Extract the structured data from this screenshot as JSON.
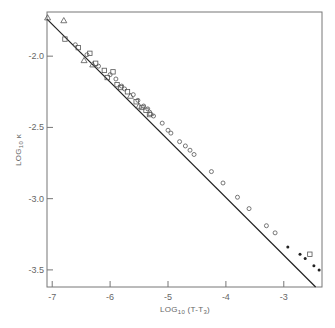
{
  "chart_data": {
    "type": "scatter",
    "title": "",
    "xlabel": "LOG10 (T-T3)",
    "xlabel_parts": {
      "main": "LOG",
      "sub": "10",
      "rest": " (T-T",
      "sub2": "3",
      "end": ")"
    },
    "ylabel": "LOG10 κ",
    "ylabel_parts": {
      "main": "LOG",
      "sub": "10",
      "rest": " κ"
    },
    "xlim": [
      -7.09,
      -2.34
    ],
    "ylim": [
      -3.62,
      -1.69
    ],
    "xticks": [
      -7,
      -6,
      -5,
      -4,
      -3
    ],
    "xtick_labels": [
      "-7",
      "-6",
      "-5",
      "-4",
      "-3"
    ],
    "yticks": [
      -2.0,
      -2.5,
      -3.0,
      -3.5
    ],
    "ytick_labels": [
      "-2.0",
      "-2.5",
      "-3.0",
      "-3.5"
    ],
    "grid": false,
    "legend": null,
    "fit_line": {
      "x": [
        -7.09,
        -2.45
      ],
      "y": [
        -1.74,
        -3.62
      ]
    },
    "series": [
      {
        "name": "triangles",
        "marker": "triangle-open",
        "points": [
          [
            -7.08,
            -1.73
          ],
          [
            -6.8,
            -1.75
          ],
          [
            -6.45,
            -2.03
          ],
          [
            -6.3,
            -2.06
          ],
          [
            -5.65,
            -2.28
          ],
          [
            -5.5,
            -2.35
          ],
          [
            -5.3,
            -2.4
          ]
        ]
      },
      {
        "name": "squares",
        "marker": "square-open",
        "points": [
          [
            -6.78,
            -1.88
          ],
          [
            -6.55,
            -1.94
          ],
          [
            -6.35,
            -1.98
          ],
          [
            -6.25,
            -2.05
          ],
          [
            -6.1,
            -2.1
          ],
          [
            -6.05,
            -2.15
          ],
          [
            -5.95,
            -2.11
          ],
          [
            -5.88,
            -2.2
          ],
          [
            -5.82,
            -2.22
          ],
          [
            -5.7,
            -2.25
          ],
          [
            -5.55,
            -2.32
          ],
          [
            -5.45,
            -2.36
          ],
          [
            -5.38,
            -2.38
          ],
          [
            -5.32,
            -2.41
          ],
          [
            -2.55,
            -3.39
          ]
        ]
      },
      {
        "name": "circles",
        "marker": "circle-open",
        "points": [
          [
            -6.6,
            -1.92
          ],
          [
            -6.4,
            -1.99
          ],
          [
            -6.2,
            -2.07
          ],
          [
            -6.0,
            -2.13
          ],
          [
            -5.9,
            -2.16
          ],
          [
            -5.8,
            -2.21
          ],
          [
            -5.75,
            -2.23
          ],
          [
            -5.6,
            -2.27
          ],
          [
            -5.52,
            -2.31
          ],
          [
            -5.42,
            -2.35
          ],
          [
            -5.35,
            -2.37
          ],
          [
            -5.25,
            -2.42
          ],
          [
            -5.1,
            -2.47
          ],
          [
            -5.0,
            -2.52
          ],
          [
            -4.95,
            -2.54
          ],
          [
            -4.8,
            -2.6
          ],
          [
            -4.7,
            -2.63
          ],
          [
            -4.62,
            -2.66
          ],
          [
            -4.55,
            -2.69
          ],
          [
            -4.25,
            -2.81
          ],
          [
            -4.05,
            -2.89
          ],
          [
            -3.8,
            -2.99
          ],
          [
            -3.6,
            -3.07
          ],
          [
            -3.3,
            -3.19
          ],
          [
            -3.15,
            -3.24
          ]
        ]
      },
      {
        "name": "filled-dots",
        "marker": "circle-filled",
        "points": [
          [
            -2.93,
            -3.34
          ],
          [
            -2.72,
            -3.39
          ],
          [
            -2.63,
            -3.42
          ],
          [
            -2.48,
            -3.47
          ],
          [
            -2.39,
            -3.5
          ]
        ]
      }
    ]
  }
}
